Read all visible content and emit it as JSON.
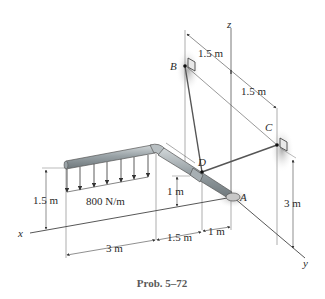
{
  "figure": {
    "caption": "Prob. 5–72",
    "axes": {
      "x": "x",
      "y": "y",
      "z": "z"
    },
    "points": {
      "A": "A",
      "B": "B",
      "C": "C",
      "D": "D"
    },
    "load": {
      "label": "800 N/m"
    },
    "dimensions": {
      "b_to_z": "1.5 m",
      "z_to_c": "1.5 m",
      "load_height": "1.5 m",
      "d_height": "1 m",
      "c_height": "3 m",
      "x_3m": "3 m",
      "x_1_5m": "1.5 m",
      "x_1m": "1 m"
    }
  },
  "colors": {
    "line": "#4a4a4a",
    "pipe": "#8a9296",
    "pipe_highlight": "#c9cfd2",
    "shadow": "#bdbdbd"
  }
}
